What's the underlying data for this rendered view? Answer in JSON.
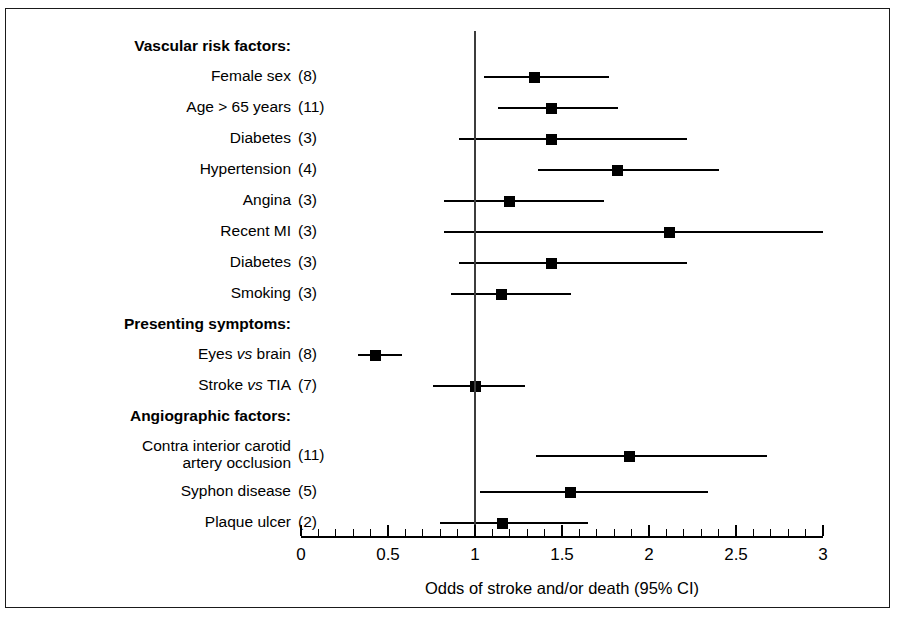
{
  "figure": {
    "axis_title": "Odds of stroke and/or death (95% CI)",
    "border_color": "#1a1a1a"
  },
  "axis": {
    "tick_labels": [
      "0",
      "0.5",
      "1",
      "1.5",
      "2",
      "2.5",
      "3"
    ],
    "tick_values": [
      0,
      0.5,
      1,
      1.5,
      2,
      2.5,
      3
    ],
    "minor_step": 0.1,
    "min": 0,
    "max": 3
  },
  "groups": [
    {
      "title": "Vascular risk factors:"
    },
    {
      "title": "Presenting symptoms:"
    },
    {
      "title": "Angiographic factors:"
    }
  ],
  "rows": [
    {
      "kind": "header",
      "label": "Vascular risk factors:"
    },
    {
      "kind": "data",
      "label": "Female sex",
      "label_html": "Female sex",
      "count": "(8)",
      "estimate": 1.34,
      "low": 1.05,
      "high": 1.77
    },
    {
      "kind": "data",
      "label": "Age > 65 years",
      "label_html": "Age > 65 years",
      "count": "(11)",
      "estimate": 1.44,
      "low": 1.13,
      "high": 1.82
    },
    {
      "kind": "data",
      "label": "Diabetes",
      "label_html": "Diabetes",
      "count": "(3)",
      "estimate": 1.44,
      "low": 0.91,
      "high": 2.22
    },
    {
      "kind": "data",
      "label": "Hypertension",
      "label_html": "Hypertension",
      "count": "(4)",
      "estimate": 1.82,
      "low": 1.36,
      "high": 2.4
    },
    {
      "kind": "data",
      "label": "Angina",
      "label_html": "Angina",
      "count": "(3)",
      "estimate": 1.2,
      "low": 0.82,
      "high": 1.74
    },
    {
      "kind": "data",
      "label": "Recent MI",
      "label_html": "Recent MI",
      "count": "(3)",
      "estimate": 2.12,
      "low": 0.82,
      "high": 3.0
    },
    {
      "kind": "data",
      "label": "Diabetes",
      "label_html": "Diabetes",
      "count": "(3)",
      "estimate": 1.44,
      "low": 0.91,
      "high": 2.22
    },
    {
      "kind": "data",
      "label": "Smoking",
      "label_html": "Smoking",
      "count": "(3)",
      "estimate": 1.15,
      "low": 0.86,
      "high": 1.55
    },
    {
      "kind": "header",
      "label": "Presenting symptoms:"
    },
    {
      "kind": "data",
      "label": "Eyes vs brain",
      "label_html": "Eyes <i>vs</i> brain",
      "count": "(8)",
      "estimate": 0.43,
      "low": 0.33,
      "high": 0.58
    },
    {
      "kind": "data",
      "label": "Stroke vs TIA",
      "label_html": "Stroke <i>vs</i> TIA",
      "count": "(7)",
      "estimate": 1.0,
      "low": 0.76,
      "high": 1.29
    },
    {
      "kind": "header",
      "label": "Angiographic factors:"
    },
    {
      "kind": "data",
      "label": "Contra interior carotid artery occlusion",
      "label_html": "Contra interior carotid<br>artery occlusion",
      "count": "(11)",
      "estimate": 1.89,
      "low": 1.35,
      "high": 2.68
    },
    {
      "kind": "data",
      "label": "Syphon disease",
      "label_html": "Syphon disease",
      "count": "(5)",
      "estimate": 1.55,
      "low": 1.03,
      "high": 2.34
    },
    {
      "kind": "data",
      "label": "Plaque ulcer",
      "label_html": "Plaque ulcer",
      "count": "(2)",
      "estimate": 1.16,
      "low": 0.8,
      "high": 1.65
    }
  ],
  "chart_data": {
    "type": "scatter",
    "title": "",
    "xlabel": "Odds of stroke and/or death (95% CI)",
    "ylabel": "",
    "xlim": [
      0,
      3
    ],
    "grid": false,
    "reference_line": 1.0,
    "xticks": [
      0,
      0.5,
      1,
      1.5,
      2,
      2.5,
      3
    ],
    "xticklabels": [
      "0",
      "0.5",
      "1",
      "1.5",
      "2",
      "2.5",
      "3"
    ],
    "categories": [
      "Female sex (8)",
      "Age > 65 years (11)",
      "Diabetes (3)",
      "Hypertension (4)",
      "Angina (3)",
      "Recent MI (3)",
      "Diabetes (3)",
      "Smoking (3)",
      "Eyes vs brain (8)",
      "Stroke vs TIA (7)",
      "Contra interior carotid artery occlusion (11)",
      "Syphon disease (5)",
      "Plaque ulcer (2)"
    ],
    "values": [
      1.34,
      1.44,
      1.44,
      1.82,
      1.2,
      2.12,
      1.44,
      1.15,
      0.43,
      1.0,
      1.89,
      1.55,
      1.16
    ],
    "ci_low": [
      1.05,
      1.13,
      0.91,
      1.36,
      0.82,
      0.82,
      0.91,
      0.86,
      0.33,
      0.76,
      1.35,
      1.03,
      0.8
    ],
    "ci_high": [
      1.77,
      1.82,
      2.22,
      2.4,
      1.74,
      3.0,
      2.22,
      1.55,
      0.58,
      1.29,
      2.68,
      2.34,
      1.65
    ],
    "group_headers": [
      {
        "label": "Vascular risk factors:",
        "before_index": 0
      },
      {
        "label": "Presenting symptoms:",
        "before_index": 8
      },
      {
        "label": "Angiographic factors:",
        "before_index": 10
      }
    ]
  }
}
